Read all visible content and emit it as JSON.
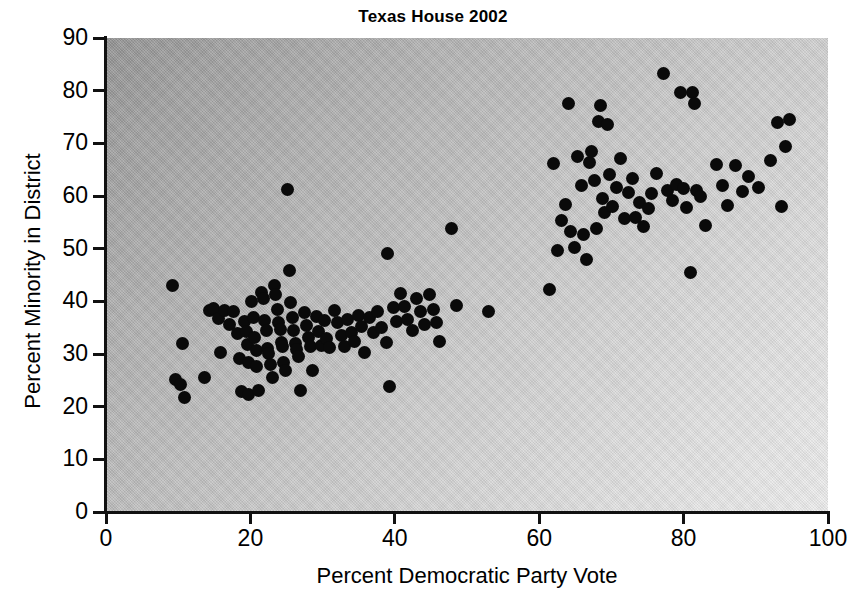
{
  "chart_data": {
    "type": "scatter",
    "title": "Texas House 2002",
    "xlabel": "Percent Democratic Party Vote",
    "ylabel": "Percent Minority in District",
    "xlim": [
      0,
      100
    ],
    "ylim": [
      0,
      90
    ],
    "xticks": [
      0,
      20,
      40,
      60,
      80,
      100
    ],
    "yticks": [
      0,
      10,
      20,
      30,
      40,
      50,
      60,
      70,
      80,
      90
    ],
    "xtick_labels": [
      "0",
      "20",
      "40",
      "60",
      "80",
      "100"
    ],
    "ytick_labels": [
      "0",
      "10",
      "20",
      "30",
      "40",
      "50",
      "60",
      "70",
      "80",
      "90"
    ],
    "grid": false,
    "legend": null,
    "marker": "filled-circle",
    "marker_color": "#0a0a0a",
    "plot_background": "diagonal-gray-gradient",
    "points": [
      [
        9.2,
        43.0
      ],
      [
        9.6,
        25.2
      ],
      [
        10.3,
        24.3
      ],
      [
        10.6,
        32.0
      ],
      [
        10.9,
        21.7
      ],
      [
        13.6,
        25.5
      ],
      [
        14.3,
        38.3
      ],
      [
        14.9,
        38.6
      ],
      [
        15.6,
        36.8
      ],
      [
        15.9,
        30.2
      ],
      [
        16.4,
        38.2
      ],
      [
        17.1,
        35.6
      ],
      [
        17.6,
        38.1
      ],
      [
        18.2,
        33.9
      ],
      [
        18.5,
        29.2
      ],
      [
        18.8,
        22.8
      ],
      [
        19.2,
        36.2
      ],
      [
        19.4,
        34.3
      ],
      [
        19.6,
        31.8
      ],
      [
        19.7,
        28.3
      ],
      [
        19.8,
        22.4
      ],
      [
        20.2,
        40.0
      ],
      [
        20.4,
        37.0
      ],
      [
        20.6,
        33.2
      ],
      [
        20.8,
        30.6
      ],
      [
        20.9,
        27.6
      ],
      [
        21.1,
        23.0
      ],
      [
        21.5,
        41.6
      ],
      [
        21.8,
        40.6
      ],
      [
        22.0,
        36.4
      ],
      [
        22.2,
        34.4
      ],
      [
        22.3,
        31.1
      ],
      [
        22.5,
        30.1
      ],
      [
        22.8,
        28.0
      ],
      [
        23.0,
        25.6
      ],
      [
        23.3,
        43.0
      ],
      [
        23.5,
        41.3
      ],
      [
        23.7,
        38.4
      ],
      [
        23.9,
        36.0
      ],
      [
        24.1,
        34.6
      ],
      [
        24.3,
        32.1
      ],
      [
        24.5,
        31.5
      ],
      [
        24.6,
        28.4
      ],
      [
        24.9,
        26.8
      ],
      [
        25.2,
        61.2
      ],
      [
        25.4,
        45.8
      ],
      [
        25.6,
        39.7
      ],
      [
        25.8,
        37.0
      ],
      [
        26.0,
        34.4
      ],
      [
        26.2,
        31.9
      ],
      [
        26.4,
        30.8
      ],
      [
        26.7,
        29.5
      ],
      [
        27.0,
        23.1
      ],
      [
        27.5,
        37.8
      ],
      [
        27.8,
        35.4
      ],
      [
        28.0,
        33.1
      ],
      [
        28.3,
        31.5
      ],
      [
        28.6,
        26.9
      ],
      [
        29.2,
        37.2
      ],
      [
        29.5,
        34.3
      ],
      [
        29.8,
        31.7
      ],
      [
        30.2,
        36.3
      ],
      [
        30.6,
        33.0
      ],
      [
        31.0,
        31.3
      ],
      [
        31.6,
        38.3
      ],
      [
        32.1,
        35.9
      ],
      [
        32.6,
        33.6
      ],
      [
        33.0,
        31.4
      ],
      [
        33.5,
        36.6
      ],
      [
        34.0,
        34.1
      ],
      [
        34.4,
        32.3
      ],
      [
        35.0,
        37.4
      ],
      [
        35.4,
        35.3
      ],
      [
        35.8,
        30.2
      ],
      [
        36.5,
        36.9
      ],
      [
        37.1,
        34.0
      ],
      [
        37.6,
        38.0
      ],
      [
        38.2,
        35.1
      ],
      [
        38.8,
        32.2
      ],
      [
        39.0,
        49.1
      ],
      [
        39.3,
        23.9
      ],
      [
        39.8,
        38.8
      ],
      [
        40.2,
        36.2
      ],
      [
        40.8,
        41.4
      ],
      [
        41.3,
        39.1
      ],
      [
        41.8,
        36.6
      ],
      [
        42.4,
        34.5
      ],
      [
        43.0,
        40.6
      ],
      [
        43.6,
        38.0
      ],
      [
        44.1,
        35.6
      ],
      [
        44.8,
        41.3
      ],
      [
        45.3,
        38.4
      ],
      [
        45.8,
        36.0
      ],
      [
        46.2,
        32.3
      ],
      [
        47.9,
        53.9
      ],
      [
        48.6,
        39.2
      ],
      [
        53.0,
        38.1
      ],
      [
        61.4,
        42.3
      ],
      [
        62.0,
        66.1
      ],
      [
        62.6,
        49.6
      ],
      [
        63.1,
        55.4
      ],
      [
        63.6,
        58.3
      ],
      [
        64.0,
        77.6
      ],
      [
        64.4,
        53.3
      ],
      [
        64.9,
        50.2
      ],
      [
        65.3,
        67.5
      ],
      [
        65.8,
        61.9
      ],
      [
        66.2,
        52.6
      ],
      [
        66.6,
        47.9
      ],
      [
        67.0,
        66.4
      ],
      [
        67.3,
        68.5
      ],
      [
        67.6,
        63.0
      ],
      [
        67.9,
        53.9
      ],
      [
        68.2,
        74.2
      ],
      [
        68.5,
        77.1
      ],
      [
        68.8,
        59.5
      ],
      [
        69.0,
        56.8
      ],
      [
        69.4,
        73.6
      ],
      [
        69.8,
        64.1
      ],
      [
        70.2,
        58.0
      ],
      [
        70.7,
        61.6
      ],
      [
        71.3,
        67.2
      ],
      [
        71.8,
        55.7
      ],
      [
        72.4,
        60.7
      ],
      [
        72.9,
        63.3
      ],
      [
        73.4,
        56.0
      ],
      [
        73.9,
        58.8
      ],
      [
        74.5,
        54.2
      ],
      [
        75.1,
        57.6
      ],
      [
        75.6,
        60.5
      ],
      [
        76.2,
        64.3
      ],
      [
        77.2,
        83.2
      ],
      [
        77.8,
        61.1
      ],
      [
        78.4,
        59.1
      ],
      [
        79.0,
        62.1
      ],
      [
        79.6,
        79.6
      ],
      [
        80.0,
        61.5
      ],
      [
        80.4,
        57.8
      ],
      [
        80.9,
        45.5
      ],
      [
        81.2,
        79.7
      ],
      [
        81.5,
        77.6
      ],
      [
        81.8,
        61.0
      ],
      [
        82.3,
        60.0
      ],
      [
        83.0,
        54.4
      ],
      [
        84.6,
        66.0
      ],
      [
        85.4,
        62.0
      ],
      [
        86.1,
        58.2
      ],
      [
        87.2,
        65.8
      ],
      [
        88.1,
        60.8
      ],
      [
        89.0,
        63.7
      ],
      [
        90.4,
        61.6
      ],
      [
        92.0,
        66.8
      ],
      [
        93.0,
        74.0
      ],
      [
        93.6,
        58.0
      ],
      [
        94.1,
        69.4
      ],
      [
        94.6,
        74.6
      ]
    ]
  }
}
